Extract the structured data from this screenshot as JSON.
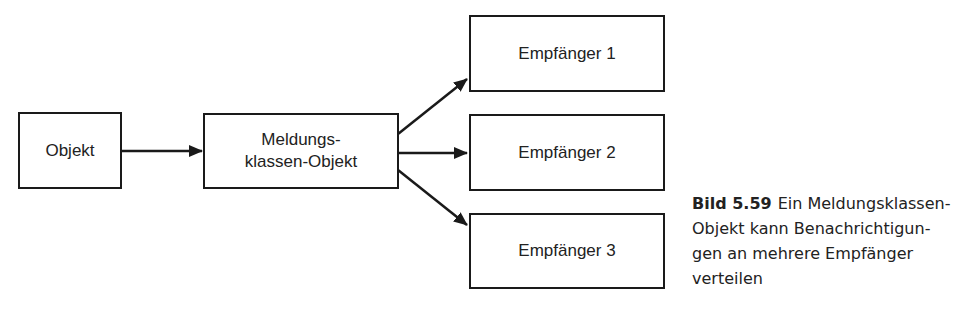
{
  "diagram": {
    "nodes": [
      {
        "id": "objekt",
        "label": "Objekt"
      },
      {
        "id": "meldung",
        "label_line1": "Meldungs-",
        "label_line2": "klassen-Objekt"
      },
      {
        "id": "empf1",
        "label": "Empfänger 1"
      },
      {
        "id": "empf2",
        "label": "Empfänger 2"
      },
      {
        "id": "empf3",
        "label": "Empfänger 3"
      }
    ],
    "edges": [
      {
        "from": "objekt",
        "to": "meldung"
      },
      {
        "from": "meldung",
        "to": "empf1"
      },
      {
        "from": "meldung",
        "to": "empf2"
      },
      {
        "from": "meldung",
        "to": "empf3"
      }
    ]
  },
  "caption": {
    "figure_number": "Bild 5.59",
    "text": "Ein Meldungsklassen-Objekt kann Benachrichtigungen an mehrere Empfänger verteilen",
    "lines": [
      "Ein Meldungsklassen-",
      "Objekt kann Benachrichtigun-",
      "gen an mehrere Empfänger",
      "verteilen"
    ]
  }
}
